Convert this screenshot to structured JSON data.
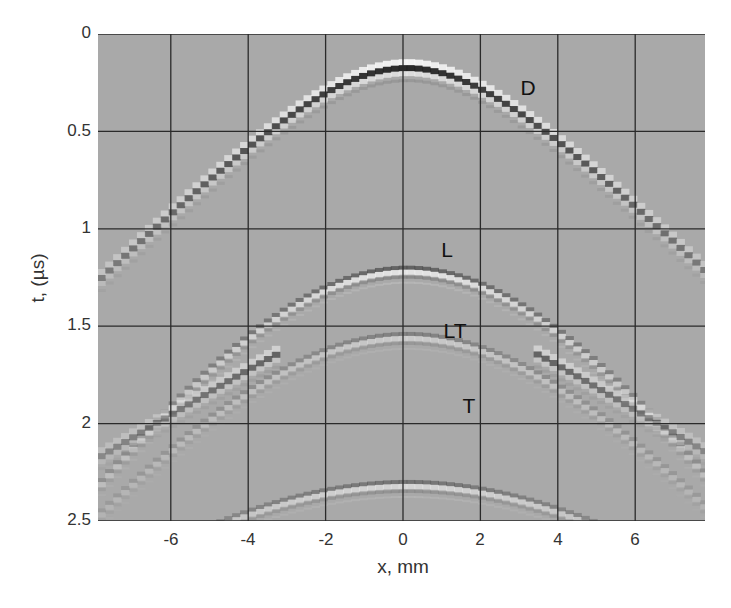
{
  "chart_data": {
    "type": "heatmap",
    "title": "",
    "xlabel": "x, mm",
    "ylabel": "t,  (µs)",
    "xlim": [
      -7.9,
      7.8
    ],
    "ylim": [
      0,
      2.5
    ],
    "y_inverted": true,
    "grid": true,
    "colormap": "gray",
    "background_color": "#a9a9a9",
    "x_ticks": [
      -6,
      -4,
      -2,
      0,
      2,
      4,
      6
    ],
    "x_tick_labels": [
      "-6",
      "-4",
      "-2",
      "0",
      "2",
      "4",
      "6"
    ],
    "y_ticks": [
      0,
      0.5,
      1,
      1.5,
      2,
      2.5
    ],
    "y_tick_labels": [
      "0",
      "0.5",
      "1",
      "1.5",
      "2",
      "2.5"
    ],
    "series": [
      {
        "name": "D",
        "apex_x": 0,
        "apex_t": 0.17,
        "curvature_t_per_mm2": 0.0245,
        "strength": 1.0,
        "style": "checker"
      },
      {
        "name": "L",
        "apex_x": 0,
        "apex_t": 1.22,
        "curvature_t_per_mm2": 0.012,
        "strength": 0.8,
        "style": "smooth"
      },
      {
        "name": "LT",
        "apex_x": 0,
        "apex_t": 1.56,
        "curvature_t_per_mm2": 0.01,
        "strength": 0.45,
        "style": "smooth"
      },
      {
        "name": "LT-steep",
        "apex_x": 0,
        "apex_t": 1.54,
        "curvature_t_per_mm2": 0.0095,
        "strength": 0.0,
        "style": "none"
      },
      {
        "name": "T",
        "apex_x": 0,
        "apex_t": 1.5,
        "curvature_t_per_mm2": 0.0123,
        "strength": 0.75,
        "style": "checker"
      },
      {
        "name": "bottom",
        "apex_x": 0,
        "apex_t": 2.32,
        "curvature_t_per_mm2": 0.0045,
        "strength": 0.6,
        "style": "smooth"
      }
    ],
    "annotations": [
      {
        "text": "D",
        "x": 3.2,
        "t": 0.28
      },
      {
        "text": "L",
        "x": 1.15,
        "t": 1.1
      },
      {
        "text": "LT",
        "x": 1.35,
        "t": 1.52
      },
      {
        "text": "T",
        "x": 1.75,
        "t": 1.94
      }
    ]
  }
}
